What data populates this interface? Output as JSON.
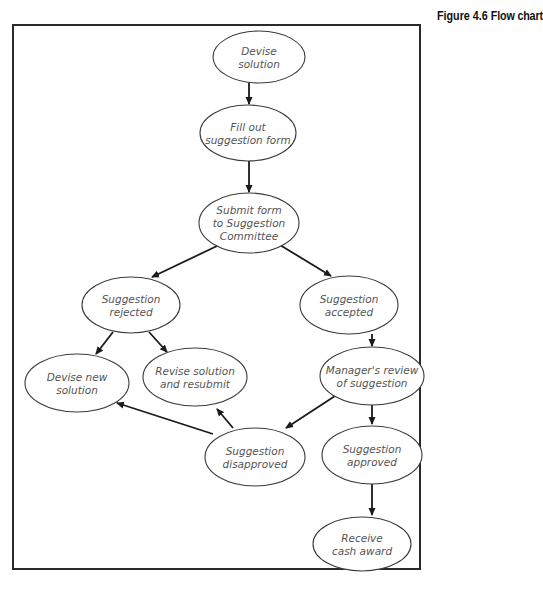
{
  "caption": {
    "figure_label": "Figure 4.6",
    "title": "Flow chart"
  },
  "colors": {
    "frame": "#2a2a2a",
    "node_stroke": "#3a3a3a",
    "node_text": "#555555",
    "arrow": "#1a1a1a"
  },
  "nodes": [
    {
      "id": "devise-solution",
      "lines": [
        "Devise",
        "solution"
      ],
      "cx": 259,
      "cy": 57,
      "rx": 46,
      "ry": 26
    },
    {
      "id": "fill-out-form",
      "lines": [
        "Fill out",
        "suggestion form"
      ],
      "cx": 248,
      "cy": 133,
      "rx": 48,
      "ry": 28
    },
    {
      "id": "submit-form",
      "lines": [
        "Submit form",
        "to Suggestion",
        "Committee"
      ],
      "cx": 249,
      "cy": 223,
      "rx": 50,
      "ry": 30
    },
    {
      "id": "suggestion-rejected",
      "lines": [
        "Suggestion",
        "rejected"
      ],
      "cx": 131,
      "cy": 305,
      "rx": 49,
      "ry": 28
    },
    {
      "id": "suggestion-accepted",
      "lines": [
        "Suggestion",
        "accepted"
      ],
      "cx": 349,
      "cy": 305,
      "rx": 49,
      "ry": 29
    },
    {
      "id": "devise-new-solution",
      "lines": [
        "Devise new",
        "solution"
      ],
      "cx": 77,
      "cy": 383,
      "rx": 52,
      "ry": 29
    },
    {
      "id": "revise-resubmit",
      "lines": [
        "Revise solution",
        "and resubmit"
      ],
      "cx": 195,
      "cy": 377,
      "rx": 52,
      "ry": 29
    },
    {
      "id": "manager-review",
      "lines": [
        "Manager's review",
        "of suggestion"
      ],
      "cx": 372,
      "cy": 376,
      "rx": 52,
      "ry": 29
    },
    {
      "id": "suggestion-disapproved",
      "lines": [
        "Suggestion",
        "disapproved"
      ],
      "cx": 255,
      "cy": 457,
      "rx": 50,
      "ry": 29
    },
    {
      "id": "suggestion-approved",
      "lines": [
        "Suggestion",
        "approved"
      ],
      "cx": 372,
      "cy": 455,
      "rx": 50,
      "ry": 29
    },
    {
      "id": "receive-cash-award",
      "lines": [
        "Receive",
        "cash award"
      ],
      "cx": 362,
      "cy": 544,
      "rx": 49,
      "ry": 27
    }
  ],
  "edges": [
    {
      "from": "devise-solution",
      "to": "fill-out-form",
      "x1": 249,
      "y1": 83,
      "x2": 249,
      "y2": 104
    },
    {
      "from": "fill-out-form",
      "to": "submit-form",
      "x1": 249,
      "y1": 161,
      "x2": 249,
      "y2": 192
    },
    {
      "from": "submit-form",
      "to": "suggestion-rejected",
      "x1": 217,
      "y1": 246,
      "x2": 152,
      "y2": 277
    },
    {
      "from": "submit-form",
      "to": "suggestion-accepted",
      "x1": 280,
      "y1": 245,
      "x2": 331,
      "y2": 276
    },
    {
      "from": "suggestion-accepted",
      "to": "manager-review",
      "x1": 372,
      "y1": 334,
      "x2": 372,
      "y2": 346
    },
    {
      "from": "suggestion-rejected",
      "to": "devise-new-solution",
      "x1": 113,
      "y1": 332,
      "x2": 96,
      "y2": 354
    },
    {
      "from": "suggestion-rejected",
      "to": "revise-resubmit",
      "x1": 149,
      "y1": 332,
      "x2": 167,
      "y2": 352
    },
    {
      "from": "manager-review",
      "to": "suggestion-disapproved",
      "x1": 335,
      "y1": 396,
      "x2": 286,
      "y2": 428
    },
    {
      "from": "manager-review",
      "to": "suggestion-approved",
      "x1": 372,
      "y1": 405,
      "x2": 372,
      "y2": 424
    },
    {
      "from": "suggestion-disapproved",
      "to": "devise-new-solution",
      "x1": 213,
      "y1": 434,
      "x2": 117,
      "y2": 403
    },
    {
      "from": "suggestion-disapproved",
      "to": "revise-resubmit",
      "x1": 233,
      "y1": 428,
      "x2": 217,
      "y2": 409
    },
    {
      "from": "suggestion-approved",
      "to": "receive-cash-award",
      "x1": 372,
      "y1": 484,
      "x2": 372,
      "y2": 515
    }
  ]
}
